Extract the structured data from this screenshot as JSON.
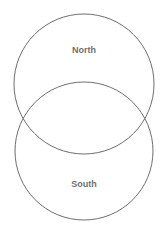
{
  "diagram": {
    "type": "venn",
    "sets": [
      {
        "id": "north",
        "label": "North",
        "cx": 84,
        "cy": 84,
        "r": 70,
        "label_x": 84,
        "label_y": 53
      },
      {
        "id": "south",
        "label": "South",
        "cx": 84,
        "cy": 151,
        "r": 69,
        "label_x": 84,
        "label_y": 187
      }
    ],
    "stroke_color": "#6e6e6e",
    "label_color": "#6f6f6f",
    "background": "#ffffff"
  }
}
